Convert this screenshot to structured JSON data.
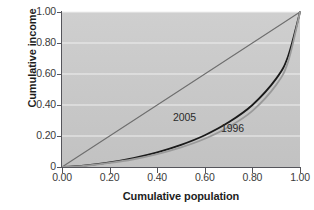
{
  "chart_data": {
    "type": "line",
    "title": "",
    "xlabel": "Cumulative population",
    "ylabel": "Cumulative income",
    "xlim": [
      0.0,
      1.0
    ],
    "ylim": [
      0.0,
      1.0
    ],
    "grid": "horizontal",
    "legend_position": "inline-annotation",
    "x_ticks": [
      "0.00",
      "0.20",
      "0.40",
      "0.60",
      "0.80",
      "1.00"
    ],
    "x_tick_values": [
      0.0,
      0.2,
      0.4,
      0.6,
      0.8,
      1.0
    ],
    "y_ticks": [
      "0",
      "0.20",
      "0.40",
      "0.60",
      "0.80",
      "1.00"
    ],
    "y_tick_values": [
      0.0,
      0.2,
      0.4,
      0.6,
      0.8,
      1.0
    ],
    "annotations": [
      {
        "text": "2005",
        "x": 0.47,
        "y": 0.3
      },
      {
        "text": "1996",
        "x": 0.67,
        "y": 0.25
      }
    ],
    "series": [
      {
        "name": "line-of-equality",
        "label": "",
        "color": "#6e6e6e",
        "x": [
          0.0,
          1.0
        ],
        "values": [
          0.0,
          1.0
        ]
      },
      {
        "name": "2005",
        "label": "2005",
        "color": "#1a1a1a",
        "x": [
          0.0,
          0.05,
          0.1,
          0.2,
          0.3,
          0.4,
          0.5,
          0.6,
          0.7,
          0.8,
          0.9,
          0.95,
          1.0
        ],
        "values": [
          0.0,
          0.004,
          0.01,
          0.03,
          0.058,
          0.095,
          0.143,
          0.205,
          0.288,
          0.4,
          0.57,
          0.715,
          1.0
        ]
      },
      {
        "name": "1996",
        "label": "1996",
        "color": "#9a9a9a",
        "x": [
          0.0,
          0.05,
          0.1,
          0.2,
          0.3,
          0.4,
          0.5,
          0.6,
          0.7,
          0.8,
          0.9,
          0.95,
          1.0
        ],
        "values": [
          0.0,
          0.003,
          0.008,
          0.026,
          0.05,
          0.083,
          0.126,
          0.182,
          0.258,
          0.362,
          0.53,
          0.68,
          1.0
        ]
      }
    ]
  },
  "axes": {
    "y_title": "Cumulative income",
    "x_title": "Cumulative population",
    "y_tick_labels": [
      "1.00",
      "0.80",
      "0.60",
      "0.40",
      "0.20",
      "0"
    ],
    "x_tick_labels": [
      "0.00",
      "0.20",
      "0.40",
      "0.60",
      "0.80",
      "1.00"
    ]
  },
  "colors": {
    "plot_background": "#c9c9c9",
    "gridline": "#f0f0f0",
    "axis": "#55555b",
    "equality_line": "#6e6e6e",
    "series_2005": "#1a1a1a",
    "series_1996": "#9a9a9a",
    "page_background": "#ffffff"
  }
}
